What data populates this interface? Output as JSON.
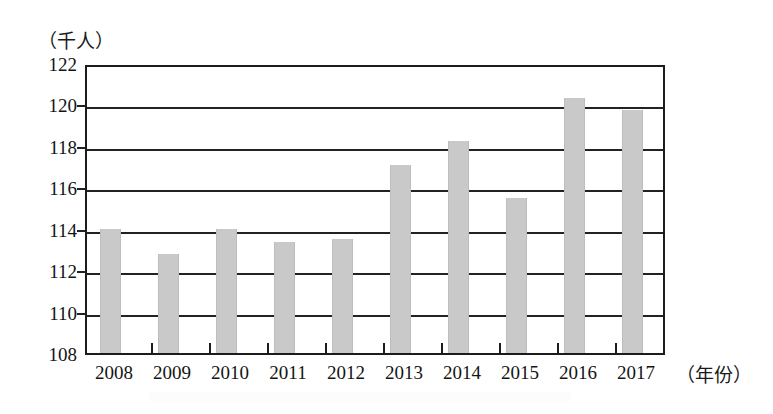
{
  "chart_data": {
    "type": "bar",
    "title": "",
    "xlabel": "（年份）",
    "ylabel": "（千人）",
    "categories": [
      "2008",
      "2009",
      "2010",
      "2011",
      "2012",
      "2013",
      "2014",
      "2015",
      "2016",
      "2017"
    ],
    "values": [
      114.0,
      112.8,
      114.0,
      113.35,
      113.5,
      117.1,
      118.25,
      115.5,
      120.3,
      119.75
    ],
    "ylim": [
      108,
      122
    ],
    "ytick_step": 2,
    "ytick_labels": [
      "122",
      "120",
      "118",
      "116",
      "114",
      "112",
      "110",
      "108"
    ],
    "ytick_values": [
      122,
      120,
      118,
      116,
      114,
      112,
      110,
      108
    ],
    "grid": true,
    "grid_axis": "y",
    "legend": null,
    "bar_color": "#c9c9c9",
    "axis_color": "#1c1c1c",
    "series_name": ""
  },
  "axes": {
    "y_unit_caption": "（千人）",
    "x_unit_caption": "（年份）"
  }
}
